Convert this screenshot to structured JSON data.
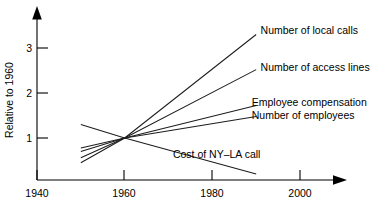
{
  "chart_data": {
    "type": "line",
    "title": "",
    "xlabel": "",
    "ylabel": "Relative to 1960",
    "xlim": [
      1940,
      2004
    ],
    "ylim": [
      0,
      3.6
    ],
    "grid": false,
    "legend_position": "inline-right-labels",
    "xticks": [
      1940,
      1960,
      1980,
      2000
    ],
    "xtick_labels": [
      "1940",
      "1960",
      "1980",
      "2000"
    ],
    "yticks": [
      1,
      2,
      3
    ],
    "ytick_labels": [
      "1",
      "2",
      "3"
    ],
    "baseline_year": 1960,
    "baseline_value": 1,
    "axis_style": "arrow-tipped open axes",
    "series": [
      {
        "name": "Number of local calls",
        "label": "Number of local calls",
        "x": [
          1950,
          1960,
          1990
        ],
        "values": [
          0.45,
          1.0,
          3.3
        ],
        "label_x": 1991,
        "label_y": 3.38
      },
      {
        "name": "Number of access lines",
        "label": "Number of access lines",
        "x": [
          1950,
          1960,
          1990
        ],
        "values": [
          0.56,
          1.0,
          2.52
        ],
        "label_x": 1991,
        "label_y": 2.56
      },
      {
        "name": "Employee compensation",
        "label": "Employee compensation",
        "x": [
          1950,
          1960,
          1990
        ],
        "values": [
          0.7,
          1.0,
          1.72
        ],
        "label_x": 1989,
        "label_y": 1.77
      },
      {
        "name": "Number of employees",
        "label": "Number of employees",
        "x": [
          1950,
          1960,
          1990
        ],
        "values": [
          0.78,
          1.0,
          1.48
        ],
        "label_x": 1989,
        "label_y": 1.49
      },
      {
        "name": "Cost of NY-LA call",
        "label": "Cost of NY–LA call",
        "x": [
          1950,
          1960,
          1990
        ],
        "values": [
          1.3,
          1.0,
          0.2
        ],
        "label_x": 1971,
        "label_y": 0.62
      }
    ]
  },
  "axes": {
    "y_title": "Relative to 1960",
    "x_tick_labels": [
      "1940",
      "1960",
      "1980",
      "2000"
    ],
    "y_tick_labels": [
      "1",
      "2",
      "3"
    ]
  },
  "colors": {
    "background": "#ffffff",
    "ink": "#000000",
    "series_stroke": "#1d1d1d"
  }
}
